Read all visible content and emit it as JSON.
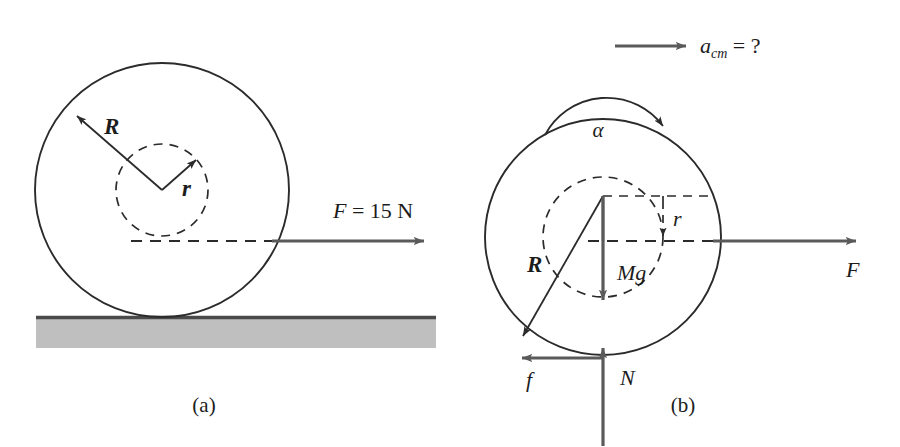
{
  "figure": {
    "background_color": "#ffffff",
    "line_color": "#2b2b2b",
    "vector_color": "#5a5a5a",
    "ground_fill_color": "#bfbfbf",
    "panels": [
      {
        "id": "a",
        "caption": "(a)",
        "description": "Spool of outer radius R and inner radius r resting on a horizontal surface, pulled by a horizontal force applied at the inner radius.",
        "labels": {
          "outer_radius": "R",
          "inner_radius": "r",
          "applied_force": "F = 15 N"
        },
        "geometry": {
          "outer_circle": {
            "cx": 162,
            "cy": 190,
            "r": 127
          },
          "inner_circle": {
            "cx": 162,
            "cy": 190,
            "r": 46
          },
          "force_line_y": 241,
          "ground_line_y": 317
        }
      },
      {
        "id": "b",
        "caption": "(b)",
        "description": "Free-body diagram of the spool showing weight, normal force, friction, applied force, angular acceleration and unknown center-of-mass acceleration.",
        "labels": {
          "acceleration": "a",
          "acceleration_subscript": "cm",
          "acceleration_equals": "= ?",
          "angular_acceleration": "α",
          "outer_radius": "R",
          "inner_radius": "r",
          "weight": "Mg",
          "applied_force": "F",
          "friction": "f",
          "normal_force": "N"
        },
        "geometry": {
          "outer_circle": {
            "cx": 603,
            "cy": 237,
            "r": 118
          },
          "inner_circle": {
            "cx": 603,
            "cy": 237,
            "r": 60
          },
          "force_line_y": 241,
          "contact_point_y": 355
        }
      }
    ]
  }
}
